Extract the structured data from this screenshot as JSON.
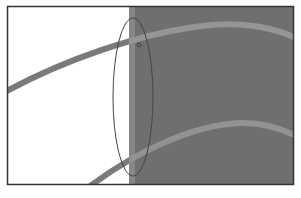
{
  "figure": {
    "frame": {
      "x": 7,
      "y": 6,
      "width": 287,
      "height": 179
    },
    "colors": {
      "background": "#ffffff",
      "dark_region": "#6e6e6e",
      "band_on_light": "#7a7a7a",
      "band_on_dark": "#8f8f8f",
      "edge_strip": "#858585",
      "frame": "#333333",
      "ellipse": "#444444"
    },
    "dark_region_start_x": 129,
    "marker_label": "o"
  }
}
